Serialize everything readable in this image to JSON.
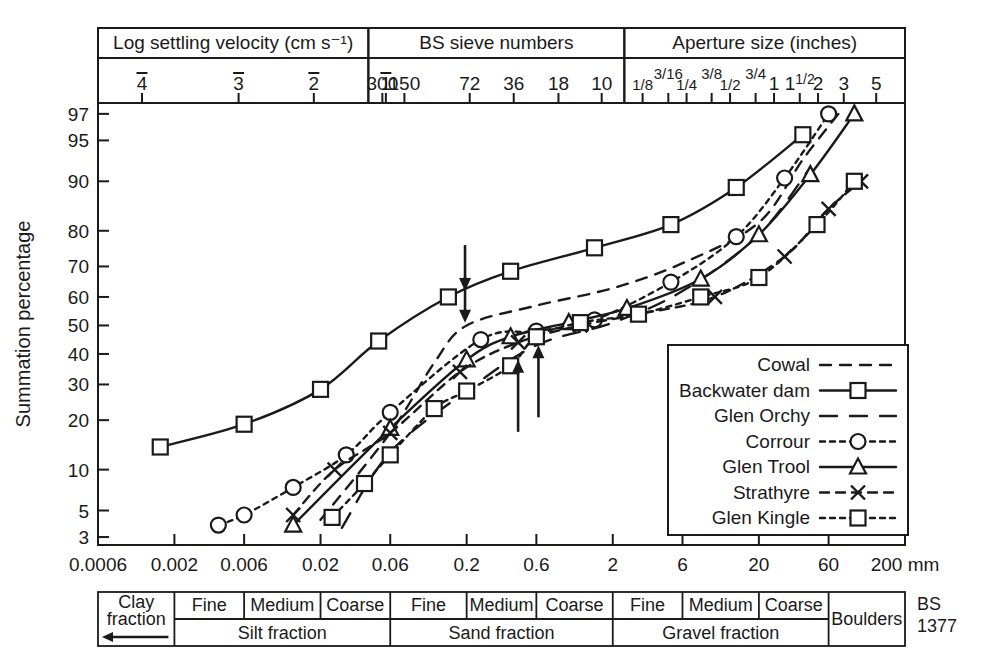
{
  "figure": {
    "y_axis_title": "Summation percentage",
    "x_unit_label": "200 mm",
    "standard_label_line1": "BS",
    "standard_label_line2": "1377"
  },
  "top_axes": [
    {
      "name": "log-settling-velocity",
      "title": "Log settling velocity (cm s⁻¹)",
      "ticks": [
        {
          "label": "4",
          "overbar": true,
          "mm": 0.0012
        },
        {
          "label": "3",
          "overbar": true,
          "mm": 0.0055
        },
        {
          "label": "2",
          "overbar": true,
          "mm": 0.018
        },
        {
          "label": "1",
          "overbar": true,
          "mm": 0.056
        }
      ]
    },
    {
      "name": "bs-sieve-numbers",
      "title": "BS sieve numbers",
      "ticks": [
        {
          "label": "300",
          "mm": 0.053
        },
        {
          "label": "150",
          "mm": 0.075
        },
        {
          "label": "72",
          "mm": 0.21
        },
        {
          "label": "36",
          "mm": 0.42
        },
        {
          "label": "18",
          "mm": 0.85
        },
        {
          "label": "10",
          "mm": 1.68
        }
      ]
    },
    {
      "name": "aperture-size-inches",
      "title": "Aperture size (inches)",
      "ticks": [
        {
          "label": "1/8",
          "num": "1",
          "den": "8",
          "mm": 3.2
        },
        {
          "label": "3/16",
          "num": "3",
          "den": "16",
          "mm": 4.8
        },
        {
          "label": "1/4",
          "num": "1",
          "den": "4",
          "mm": 6.4
        },
        {
          "label": "3/8",
          "num": "3",
          "den": "8",
          "mm": 9.5
        },
        {
          "label": "1/2",
          "num": "1",
          "den": "2",
          "mm": 12.7
        },
        {
          "label": "3/4",
          "num": "3",
          "den": "4",
          "mm": 19.0
        },
        {
          "label": "1",
          "mm": 25.4
        },
        {
          "label": "1 1/2",
          "whole": "1",
          "num": "1",
          "den": "2",
          "mm": 38.1
        },
        {
          "label": "2",
          "mm": 50.8
        },
        {
          "label": "3",
          "mm": 76.2
        },
        {
          "label": "5",
          "mm": 127.0
        }
      ]
    }
  ],
  "x_ticks": [
    {
      "label": "0.0006",
      "mm": 0.0006
    },
    {
      "label": "0.002",
      "mm": 0.002
    },
    {
      "label": "0.006",
      "mm": 0.006
    },
    {
      "label": "0.02",
      "mm": 0.02
    },
    {
      "label": "0.06",
      "mm": 0.06
    },
    {
      "label": "0.2",
      "mm": 0.2
    },
    {
      "label": "0.6",
      "mm": 0.6
    },
    {
      "label": "2",
      "mm": 2
    },
    {
      "label": "6",
      "mm": 6
    },
    {
      "label": "20",
      "mm": 20
    },
    {
      "label": "60",
      "mm": 60
    },
    {
      "label": "200 mm",
      "mm": 200
    }
  ],
  "y_ticks": [
    3,
    5,
    10,
    20,
    30,
    40,
    50,
    60,
    70,
    80,
    90,
    95,
    97
  ],
  "annotations": {
    "arrows": [
      {
        "name": "arrow-down-1",
        "dir": "down",
        "mm": 0.195,
        "pct_tip": 62
      },
      {
        "name": "arrow-down-2",
        "dir": "down",
        "mm": 0.195,
        "pct_tip": 51
      },
      {
        "name": "arrow-up-1",
        "dir": "up",
        "mm": 0.45,
        "pct_tip": 38
      },
      {
        "name": "arrow-up-2",
        "dir": "up",
        "mm": 0.62,
        "pct_tip": 43
      }
    ]
  },
  "chart_data": {
    "type": "line",
    "xlabel": "Particle size (mm)",
    "ylabel": "Summation percentage",
    "xscale": "log",
    "yscale": "probability",
    "xlim": [
      0.0006,
      200
    ],
    "ylim": [
      3,
      97
    ],
    "grid": false,
    "legend_position": "bottom-right",
    "series": [
      {
        "name": "Cowal",
        "marker": "none",
        "dash": "dashed-short",
        "points": [
          {
            "x": 0.02,
            "y": 4.2
          },
          {
            "x": 0.06,
            "y": 17
          },
          {
            "x": 0.12,
            "y": 37
          },
          {
            "x": 0.2,
            "y": 50
          },
          {
            "x": 0.6,
            "y": 57
          },
          {
            "x": 2.0,
            "y": 63
          },
          {
            "x": 6.0,
            "y": 71
          },
          {
            "x": 20.0,
            "y": 82
          },
          {
            "x": 40.0,
            "y": 93
          },
          {
            "x": 70.0,
            "y": 97
          }
        ]
      },
      {
        "name": "Backwater dam",
        "marker": "square",
        "dash": "solid",
        "points": [
          {
            "x": 0.0016,
            "y": 14
          },
          {
            "x": 0.006,
            "y": 19
          },
          {
            "x": 0.02,
            "y": 28.5
          },
          {
            "x": 0.05,
            "y": 44.5
          },
          {
            "x": 0.15,
            "y": 60
          },
          {
            "x": 0.4,
            "y": 68.5
          },
          {
            "x": 1.5,
            "y": 75.5
          },
          {
            "x": 5.0,
            "y": 81.5
          },
          {
            "x": 14.0,
            "y": 89
          },
          {
            "x": 40.0,
            "y": 95.5
          }
        ]
      },
      {
        "name": "Glen Orchy",
        "marker": "none",
        "dash": "dashed-long",
        "points": [
          {
            "x": 0.028,
            "y": 3.6
          },
          {
            "x": 0.06,
            "y": 13
          },
          {
            "x": 0.2,
            "y": 28
          },
          {
            "x": 0.6,
            "y": 43
          },
          {
            "x": 2.0,
            "y": 51
          },
          {
            "x": 6.0,
            "y": 62
          },
          {
            "x": 20.0,
            "y": 79
          },
          {
            "x": 45.0,
            "y": 92
          }
        ]
      },
      {
        "name": "Corrour",
        "marker": "circle",
        "dash": "dotted",
        "points": [
          {
            "x": 0.004,
            "y": 3.8
          },
          {
            "x": 0.006,
            "y": 4.6
          },
          {
            "x": 0.013,
            "y": 7.5
          },
          {
            "x": 0.03,
            "y": 12.5
          },
          {
            "x": 0.06,
            "y": 22
          },
          {
            "x": 0.25,
            "y": 45
          },
          {
            "x": 0.6,
            "y": 48
          },
          {
            "x": 1.5,
            "y": 52
          },
          {
            "x": 5.0,
            "y": 65
          },
          {
            "x": 14.0,
            "y": 78.5
          },
          {
            "x": 30.0,
            "y": 90.5
          },
          {
            "x": 60.0,
            "y": 97
          }
        ]
      },
      {
        "name": "Glen Trool",
        "marker": "triangle",
        "dash": "solid",
        "points": [
          {
            "x": 0.013,
            "y": 3.8
          },
          {
            "x": 0.06,
            "y": 18
          },
          {
            "x": 0.2,
            "y": 38
          },
          {
            "x": 0.4,
            "y": 46
          },
          {
            "x": 1.0,
            "y": 51
          },
          {
            "x": 2.5,
            "y": 56
          },
          {
            "x": 8.0,
            "y": 66
          },
          {
            "x": 20.0,
            "y": 79
          },
          {
            "x": 45.0,
            "y": 91
          },
          {
            "x": 90.0,
            "y": 97
          }
        ]
      },
      {
        "name": "Strathyre",
        "marker": "cross",
        "dash": "dash-cross",
        "points": [
          {
            "x": 0.013,
            "y": 4.6
          },
          {
            "x": 0.025,
            "y": 10
          },
          {
            "x": 0.06,
            "y": 17
          },
          {
            "x": 0.18,
            "y": 34
          },
          {
            "x": 0.45,
            "y": 44
          },
          {
            "x": 1.2,
            "y": 50
          },
          {
            "x": 3.0,
            "y": 54
          },
          {
            "x": 10.0,
            "y": 60
          },
          {
            "x": 30.0,
            "y": 73
          },
          {
            "x": 60.0,
            "y": 85
          },
          {
            "x": 100.0,
            "y": 90
          }
        ]
      },
      {
        "name": "Glen Kingle",
        "marker": "square",
        "dash": "dotted",
        "points": [
          {
            "x": 0.024,
            "y": 4.4
          },
          {
            "x": 0.04,
            "y": 8
          },
          {
            "x": 0.06,
            "y": 12.5
          },
          {
            "x": 0.12,
            "y": 23
          },
          {
            "x": 0.2,
            "y": 28
          },
          {
            "x": 0.4,
            "y": 36
          },
          {
            "x": 0.6,
            "y": 46
          },
          {
            "x": 1.2,
            "y": 51
          },
          {
            "x": 3.0,
            "y": 54
          },
          {
            "x": 8.0,
            "y": 60
          },
          {
            "x": 20.0,
            "y": 66.5
          },
          {
            "x": 50.0,
            "y": 81.5
          },
          {
            "x": 90.0,
            "y": 90
          }
        ]
      }
    ]
  },
  "legend": {
    "entries": [
      {
        "label": "Cowal",
        "marker": "none",
        "dash": "dashed-short"
      },
      {
        "label": "Backwater dam",
        "marker": "square",
        "dash": "solid"
      },
      {
        "label": "Glen Orchy",
        "marker": "none",
        "dash": "dashed-long"
      },
      {
        "label": "Corrour",
        "marker": "circle",
        "dash": "dotted"
      },
      {
        "label": "Glen Trool",
        "marker": "triangle",
        "dash": "solid"
      },
      {
        "label": "Strathyre",
        "marker": "cross",
        "dash": "dash-cross"
      },
      {
        "label": "Glen Kingle",
        "marker": "square",
        "dash": "dotted"
      }
    ]
  },
  "classification": {
    "clay": {
      "line1": "Clay",
      "line2": "fraction"
    },
    "boulders": "Boulders",
    "grades": [
      {
        "fraction": "Silt fraction",
        "classes": [
          "Fine",
          "Medium",
          "Coarse"
        ]
      },
      {
        "fraction": "Sand fraction",
        "classes": [
          "Fine",
          "Medium",
          "Coarse"
        ]
      },
      {
        "fraction": "Gravel fraction",
        "classes": [
          "Fine",
          "Medium",
          "Coarse"
        ]
      }
    ]
  }
}
